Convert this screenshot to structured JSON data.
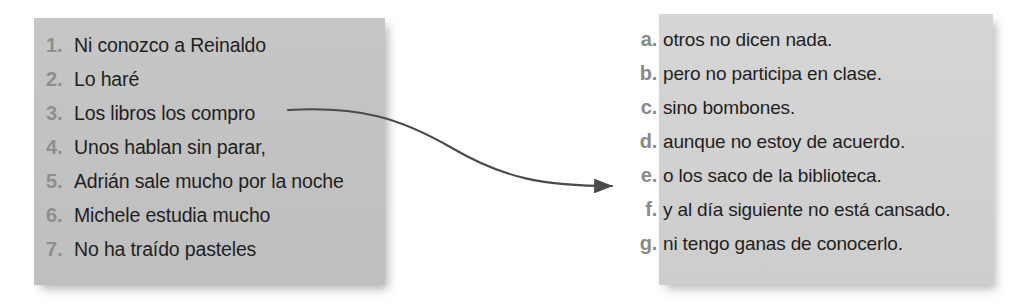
{
  "exercise": {
    "type": "matching-exercise",
    "language": "Spanish",
    "left_panel": {
      "background_color": "#c3c3c3",
      "marker_color": "#8e8e8e",
      "text_color": "#1f1f1f",
      "items": [
        {
          "marker": "1.",
          "text": "Ni conozco a Reinaldo"
        },
        {
          "marker": "2.",
          "text": "Lo haré"
        },
        {
          "marker": "3.",
          "text": "Los libros los compro"
        },
        {
          "marker": "4.",
          "text": "Unos hablan sin parar,"
        },
        {
          "marker": "5.",
          "text": "Adrián sale mucho por la noche"
        },
        {
          "marker": "6.",
          "text": "Michele estudia mucho"
        },
        {
          "marker": "7.",
          "text": "No ha traído pasteles"
        }
      ]
    },
    "right_panel": {
      "background_color": "#d2d2d2",
      "marker_color": "#8a8a8a",
      "text_color": "#1f1f1f",
      "items": [
        {
          "marker": "a.",
          "text": "otros no dicen nada."
        },
        {
          "marker": "b.",
          "text": "pero no participa en clase."
        },
        {
          "marker": "c.",
          "text": "sino bombones."
        },
        {
          "marker": "d.",
          "text": "aunque no estoy de acuerdo."
        },
        {
          "marker": "e.",
          "text": "o los saco de la biblioteca."
        },
        {
          "marker": "f.",
          "text": "y al día siguiente no está cansado."
        },
        {
          "marker": "g.",
          "text": "ni tengo ganas de conocerlo."
        }
      ]
    },
    "connector": {
      "name": "match-arrow-3-to-e",
      "from_item": "3.",
      "to_item": "e.",
      "color": "#4a4a4a",
      "path": "M 288 110 C 360 106, 400 118, 452 148 C 505 179, 545 186, 612 186",
      "arrowhead_x": 620,
      "arrowhead_y": 186
    }
  }
}
